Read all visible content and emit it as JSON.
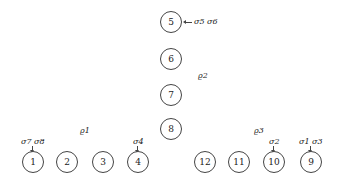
{
  "nodes": {
    "n1": "1",
    "n2": "2",
    "n3": "3",
    "n4": "4",
    "n5": "5",
    "n6": "6",
    "n7": "7",
    "n8": "8",
    "n9": "9",
    "n10": "10",
    "n11": "11",
    "n12": "12"
  },
  "groups": {
    "rho1": "ϱ1",
    "rho2": "ϱ2",
    "rho3": "ϱ3"
  },
  "annotations": {
    "node5": "σ5 σ6",
    "node1": "σ7 σ8",
    "node4": "σ4",
    "node10": "σ2",
    "node9": "σ1 σ3"
  }
}
